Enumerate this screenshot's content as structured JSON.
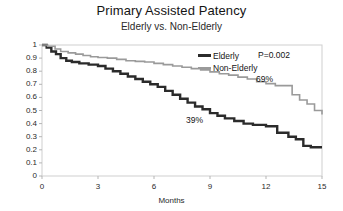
{
  "chart_data": {
    "type": "line",
    "title": "Primary Assisted Patency",
    "subtitle": "Elderly vs. Non-Elderly",
    "xlabel": "Months",
    "ylabel": "",
    "xlim": [
      0,
      15
    ],
    "ylim": [
      0,
      1
    ],
    "xticks": [
      "0",
      "3",
      "6",
      "9",
      "12",
      "15"
    ],
    "xtick_values": [
      0,
      3,
      6,
      9,
      12,
      15
    ],
    "yticks": [
      "0",
      "0.1",
      "0.2",
      "0.3",
      "0.4",
      "0.5",
      "0.6",
      "0.7",
      "0.8",
      "0.9",
      "1"
    ],
    "ytick_values": [
      0,
      0.1,
      0.2,
      0.3,
      0.4,
      0.5,
      0.6,
      0.7,
      0.8,
      0.9,
      1
    ],
    "grid": false,
    "legend_position": "upper-right",
    "pvalue_text": "P=0.002",
    "annotations": [
      {
        "text": "69%",
        "series": "Non-Elderly",
        "x": 13.1,
        "y": 0.69
      },
      {
        "text": "39%",
        "series": "Elderly",
        "x": 7.6,
        "y": 0.39
      }
    ],
    "series": [
      {
        "name": "Elderly",
        "color": "#2b2b2b",
        "linewidth": 2.4,
        "step": true,
        "points": [
          [
            0.0,
            1.0
          ],
          [
            0.25,
            0.98
          ],
          [
            0.5,
            0.95
          ],
          [
            0.75,
            0.93
          ],
          [
            1.0,
            0.9
          ],
          [
            1.3,
            0.88
          ],
          [
            1.6,
            0.87
          ],
          [
            2.0,
            0.86
          ],
          [
            2.5,
            0.85
          ],
          [
            3.0,
            0.84
          ],
          [
            3.4,
            0.82
          ],
          [
            3.8,
            0.8
          ],
          [
            4.2,
            0.78
          ],
          [
            4.6,
            0.76
          ],
          [
            5.0,
            0.74
          ],
          [
            5.4,
            0.72
          ],
          [
            5.8,
            0.7
          ],
          [
            6.2,
            0.68
          ],
          [
            6.6,
            0.65
          ],
          [
            7.0,
            0.62
          ],
          [
            7.4,
            0.59
          ],
          [
            7.8,
            0.56
          ],
          [
            8.2,
            0.53
          ],
          [
            8.6,
            0.51
          ],
          [
            9.0,
            0.48
          ],
          [
            9.4,
            0.46
          ],
          [
            9.8,
            0.44
          ],
          [
            10.3,
            0.42
          ],
          [
            10.8,
            0.4
          ],
          [
            11.3,
            0.39
          ],
          [
            12.0,
            0.38
          ],
          [
            12.6,
            0.33
          ],
          [
            13.2,
            0.3
          ],
          [
            13.6,
            0.28
          ],
          [
            14.0,
            0.23
          ],
          [
            14.4,
            0.22
          ],
          [
            15.0,
            0.22
          ]
        ]
      },
      {
        "name": "Non-Elderly",
        "color": "#9a9a9a",
        "linewidth": 1.6,
        "step": true,
        "points": [
          [
            0.0,
            1.0
          ],
          [
            0.3,
            0.99
          ],
          [
            0.7,
            0.97
          ],
          [
            1.0,
            0.95
          ],
          [
            1.4,
            0.94
          ],
          [
            1.8,
            0.93
          ],
          [
            2.2,
            0.92
          ],
          [
            2.6,
            0.91
          ],
          [
            3.0,
            0.905
          ],
          [
            3.5,
            0.9
          ],
          [
            4.0,
            0.89
          ],
          [
            4.5,
            0.88
          ],
          [
            5.0,
            0.875
          ],
          [
            5.5,
            0.87
          ],
          [
            6.0,
            0.86
          ],
          [
            6.5,
            0.85
          ],
          [
            7.0,
            0.84
          ],
          [
            7.5,
            0.83
          ],
          [
            8.0,
            0.82
          ],
          [
            8.5,
            0.81
          ],
          [
            9.0,
            0.795
          ],
          [
            9.5,
            0.78
          ],
          [
            10.0,
            0.77
          ],
          [
            10.5,
            0.755
          ],
          [
            11.0,
            0.74
          ],
          [
            11.5,
            0.72
          ],
          [
            12.0,
            0.705
          ],
          [
            12.5,
            0.69
          ],
          [
            13.0,
            0.69
          ],
          [
            13.4,
            0.62
          ],
          [
            13.8,
            0.58
          ],
          [
            14.2,
            0.55
          ],
          [
            14.6,
            0.5
          ],
          [
            15.0,
            0.47
          ]
        ]
      }
    ]
  },
  "legend": {
    "items": [
      {
        "label": "Elderly"
      },
      {
        "label": "Non-Elderly"
      }
    ]
  },
  "axes": {
    "x_title": "Months"
  }
}
